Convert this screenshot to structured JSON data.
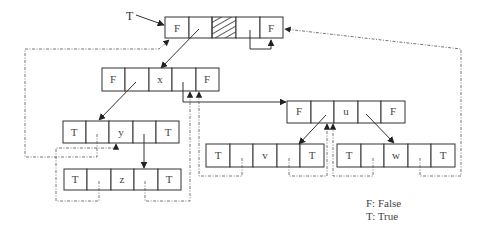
{
  "diagram": {
    "type": "threaded-binary-tree",
    "head_pointer_label": "T",
    "head": {
      "left_flag": "F",
      "data": "",
      "right_flag": "F",
      "data_hatched": true
    },
    "nodes": [
      {
        "id": "x",
        "left_flag": "F",
        "data": "x",
        "right_flag": "F"
      },
      {
        "id": "y",
        "left_flag": "T",
        "data": "y",
        "right_flag": "T"
      },
      {
        "id": "z",
        "left_flag": "T",
        "data": "z",
        "right_flag": "T"
      },
      {
        "id": "u",
        "left_flag": "F",
        "data": "u",
        "right_flag": "F"
      },
      {
        "id": "v",
        "left_flag": "T",
        "data": "v",
        "right_flag": "T"
      },
      {
        "id": "w",
        "left_flag": "T",
        "data": "w",
        "right_flag": "T"
      }
    ],
    "edges": [
      {
        "from": "head",
        "to": "x",
        "kind": "child"
      },
      {
        "from": "x",
        "to": "y",
        "kind": "child"
      },
      {
        "from": "x",
        "to": "u",
        "kind": "child"
      },
      {
        "from": "y",
        "to": "z",
        "kind": "child"
      },
      {
        "from": "u",
        "to": "v",
        "kind": "child"
      },
      {
        "from": "u",
        "to": "w",
        "kind": "child"
      },
      {
        "from": "head",
        "to": "head",
        "kind": "self-right"
      },
      {
        "from": "y",
        "to": "head",
        "kind": "thread"
      },
      {
        "from": "z",
        "to": "y",
        "kind": "thread"
      },
      {
        "from": "z",
        "to": "x",
        "kind": "thread"
      },
      {
        "from": "v",
        "to": "x",
        "kind": "thread"
      },
      {
        "from": "v",
        "to": "u",
        "kind": "thread"
      },
      {
        "from": "w",
        "to": "u",
        "kind": "thread"
      },
      {
        "from": "w",
        "to": "head",
        "kind": "thread"
      }
    ]
  },
  "legend": {
    "false": "F: False",
    "true": "T: True"
  }
}
